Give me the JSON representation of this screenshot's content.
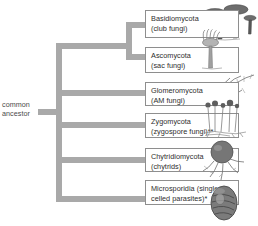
{
  "diagram": {
    "root_label": {
      "line1": "common",
      "line2": "ancestor"
    },
    "colors": {
      "branch": "#a9a9a9",
      "box_border": "#8e8e8e",
      "box_fill": "#ffffff",
      "text": "#2e2e2e",
      "illustration": "#6b6b6b"
    },
    "taxa": [
      {
        "id": "basidiomycota",
        "line1": "Basidiomycota",
        "line2": "(club fungi)",
        "illustration": "mushrooms-icon"
      },
      {
        "id": "ascomycota",
        "line1": "Ascomycota",
        "line2": "(sac fungi)",
        "illustration": "cup-fungus-icon"
      },
      {
        "id": "glomeromycota",
        "line1": "Glomeromycota",
        "line2": "(AM fungi)",
        "illustration": "mycorrhiza-icon"
      },
      {
        "id": "zygomycota",
        "line1": "Zygomycota",
        "line2": "(zygospore fungi)**",
        "illustration": "bread-mold-icon"
      },
      {
        "id": "chytridiomycota",
        "line1": "Chytridiomycota",
        "line2": "(chytrids)",
        "illustration": "chytrid-icon"
      },
      {
        "id": "microsporidia",
        "line1": "Microsporidia (single-",
        "line2": "celled parasites)*",
        "illustration": "microsporidian-icon"
      }
    ]
  }
}
